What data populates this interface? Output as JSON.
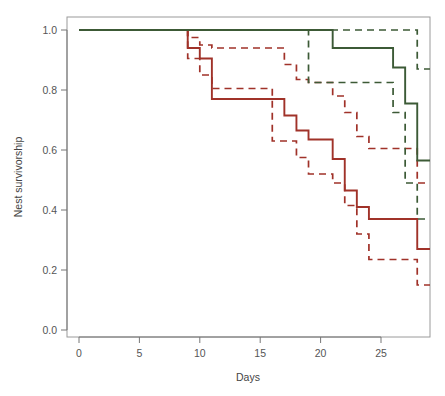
{
  "chart_data": {
    "type": "line",
    "title": "",
    "subtitle": "",
    "xlabel": "Days",
    "ylabel": "Nest survivorship",
    "xlim": [
      0,
      28
    ],
    "ylim": [
      0.0,
      1.0
    ],
    "grid": false,
    "legend_position": "none",
    "x_ticks": [
      0,
      5,
      10,
      15,
      20,
      25
    ],
    "x_tick_labels": [
      "0",
      "5",
      "10",
      "15",
      "20",
      "25"
    ],
    "y_ticks": [
      0.0,
      0.2,
      0.4,
      0.6,
      0.8,
      1.0
    ],
    "y_tick_labels": [
      "0.0",
      "0.2",
      "0.4",
      "0.6",
      "0.8",
      "1.0"
    ],
    "colors": {
      "group_a": "#A03229",
      "group_b": "#3C5A36",
      "axis": "#777777",
      "box": "#999999",
      "background": "#ffffff"
    },
    "series": [
      {
        "name": "Group A estimate",
        "color": "#A03229",
        "style": "solid",
        "step": "post",
        "x": [
          0,
          8,
          9,
          10,
          11,
          16,
          17,
          18,
          19,
          21,
          22,
          23,
          24,
          28
        ],
        "values": [
          1.0,
          1.0,
          0.94,
          0.905,
          0.77,
          0.77,
          0.715,
          0.665,
          0.635,
          0.57,
          0.465,
          0.41,
          0.37,
          0.27
        ]
      },
      {
        "name": "Group A upper 95% CI",
        "color": "#A03229",
        "style": "dashed",
        "step": "post",
        "x": [
          0,
          8,
          9,
          10,
          11,
          16,
          17,
          18,
          19,
          21,
          22,
          23,
          24,
          28
        ],
        "values": [
          1.0,
          1.0,
          0.975,
          0.95,
          0.94,
          0.94,
          0.885,
          0.835,
          0.825,
          0.78,
          0.725,
          0.645,
          0.605,
          0.49
        ]
      },
      {
        "name": "Group A lower 95% CI",
        "color": "#A03229",
        "style": "dashed",
        "step": "post",
        "x": [
          0,
          8,
          9,
          10,
          11,
          16,
          17,
          18,
          19,
          21,
          22,
          23,
          24,
          28
        ],
        "values": [
          1.0,
          1.0,
          0.905,
          0.85,
          0.805,
          0.63,
          0.63,
          0.575,
          0.52,
          0.49,
          0.415,
          0.32,
          0.235,
          0.15
        ]
      },
      {
        "name": "Group B estimate",
        "color": "#3C5A36",
        "style": "solid",
        "step": "post",
        "x": [
          0,
          11,
          19,
          21,
          26,
          27,
          28
        ],
        "values": [
          1.0,
          1.0,
          1.0,
          0.94,
          0.875,
          0.755,
          0.565
        ]
      },
      {
        "name": "Group B upper 95% CI",
        "color": "#3C5A36",
        "style": "dashed",
        "step": "post",
        "x": [
          0,
          11,
          19,
          21,
          26,
          27,
          28
        ],
        "values": [
          1.0,
          1.0,
          1.0,
          1.0,
          1.0,
          1.0,
          0.87
        ]
      },
      {
        "name": "Group B lower 95% CI",
        "color": "#3C5A36",
        "style": "dashed",
        "step": "post",
        "x": [
          0,
          11,
          19,
          21,
          26,
          27,
          28
        ],
        "values": [
          1.0,
          1.0,
          0.825,
          0.825,
          0.725,
          0.49,
          0.37
        ]
      }
    ]
  }
}
